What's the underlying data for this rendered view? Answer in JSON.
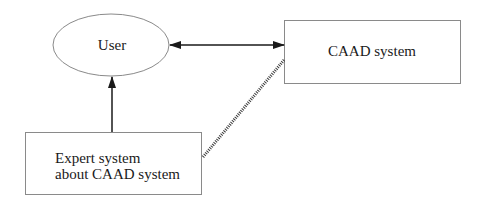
{
  "diagram": {
    "nodes": {
      "user": {
        "label": "User",
        "shape": "ellipse"
      },
      "caad": {
        "label": "CAAD system",
        "shape": "rectangle"
      },
      "expert": {
        "label_line1": "Expert system",
        "label_line2": "about CAAD system",
        "shape": "rectangle"
      }
    },
    "edges": [
      {
        "from": "user",
        "to": "caad",
        "style": "solid",
        "direction": "bidirectional"
      },
      {
        "from": "expert",
        "to": "user",
        "style": "solid",
        "direction": "forward"
      },
      {
        "from": "expert",
        "to": "caad",
        "style": "hatched",
        "direction": "none"
      }
    ],
    "colors": {
      "outline": "#8a8a8a",
      "arrow": "#1a1a1a",
      "text": "#1a1a1a"
    }
  }
}
